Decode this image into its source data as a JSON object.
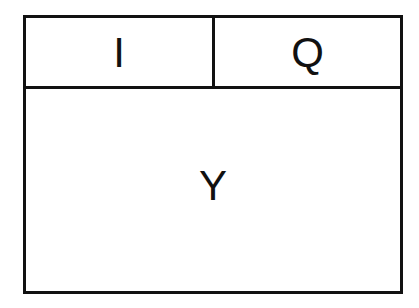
{
  "diagram": {
    "type": "block-layout",
    "cells": {
      "top_left": {
        "label": "I"
      },
      "top_right": {
        "label": "Q"
      },
      "bottom": {
        "label": "Y"
      }
    },
    "colors": {
      "line": "#111111",
      "background": "#ffffff",
      "text": "#111111"
    }
  }
}
